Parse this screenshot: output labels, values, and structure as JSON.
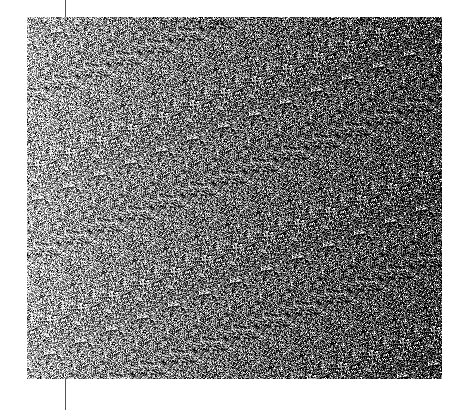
{
  "image": {
    "kind": "grayscale-noise-field",
    "background": "#ffffff",
    "noise_rect": {
      "x": 27,
      "y": 17,
      "width": 415,
      "height": 362
    },
    "gradient": {
      "direction": "left-to-right",
      "left_mean_gray": 175,
      "right_mean_gray": 60,
      "spread": 110
    },
    "guide_line": {
      "x": 65,
      "color": "#555555"
    }
  }
}
